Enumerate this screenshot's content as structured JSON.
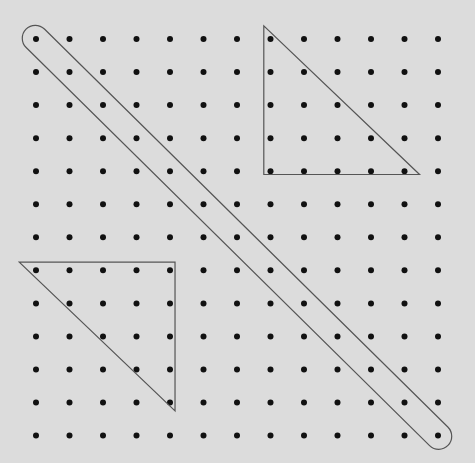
{
  "diagram": {
    "type": "dot-grid-geoboard",
    "grid": {
      "columns": 13,
      "rows": 13
    },
    "shapes": [
      {
        "name": "diagonal-band",
        "kind": "rounded-band",
        "from": {
          "col": 0,
          "row": 0
        },
        "to": {
          "col": 12,
          "row": 12
        }
      },
      {
        "name": "top-right-triangle",
        "kind": "triangle",
        "vertices": [
          {
            "col": 6.8,
            "row": -0.4
          },
          {
            "col": 6.8,
            "row": 4.1
          },
          {
            "col": 11.45,
            "row": 4.1
          }
        ]
      },
      {
        "name": "bottom-left-triangle",
        "kind": "triangle",
        "vertices": [
          {
            "col": -0.5,
            "row": 6.75
          },
          {
            "col": 4.15,
            "row": 6.75
          },
          {
            "col": 4.15,
            "row": 11.25
          }
        ]
      }
    ],
    "colors": {
      "background": "#dcdcdc",
      "dot": "#111111",
      "line": "#555555"
    }
  }
}
